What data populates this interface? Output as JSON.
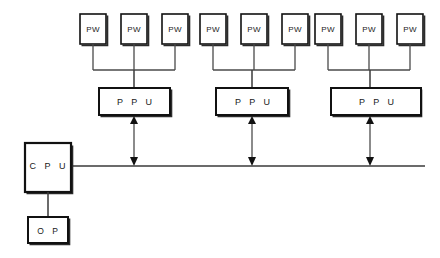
{
  "diagram": {
    "background_color": "#ffffff",
    "line_color": "#3a3a3a",
    "box_border_color": "#111111",
    "text_color": "#1a1a1a",
    "controller": {
      "cpu_label": "C P U",
      "op_label": "O P"
    },
    "bus": {
      "label": "",
      "y": 166,
      "x_start": 71,
      "x_end": 425
    },
    "groups": [
      {
        "ppu_label": "P P U",
        "workstations": [
          {
            "label": "PW"
          },
          {
            "label": "PW"
          },
          {
            "label": "PW"
          }
        ]
      },
      {
        "ppu_label": "P P U",
        "workstations": [
          {
            "label": "PW"
          },
          {
            "label": "PW"
          },
          {
            "label": "PW"
          }
        ]
      },
      {
        "ppu_label": "P P U",
        "workstations": [
          {
            "label": "PW"
          },
          {
            "label": "PW"
          },
          {
            "label": "PW"
          }
        ]
      }
    ]
  }
}
